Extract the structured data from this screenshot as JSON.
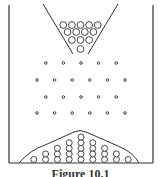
{
  "figure": {
    "caption": "Figure 10.1",
    "colors": {
      "stroke": "#333333",
      "background": "#ffffff"
    },
    "funnel": {
      "ball_rows": [
        5,
        4,
        3,
        1
      ],
      "ball_count": 13
    },
    "pegs": {
      "rows": [
        5,
        6,
        5,
        6
      ],
      "row_y": [
        63,
        80,
        97,
        113
      ]
    },
    "bins": {
      "column_heights": [
        1,
        2,
        3,
        4,
        5,
        4,
        3,
        2,
        1
      ],
      "ball_count": 25,
      "distribution_curve": "bell-shaped envelope over stacked balls"
    }
  }
}
